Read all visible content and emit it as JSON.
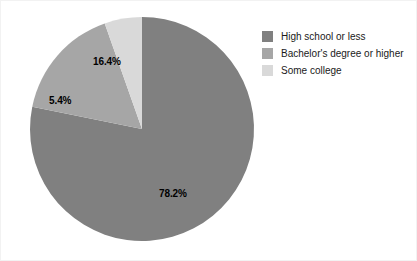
{
  "chart_data": {
    "type": "pie",
    "title": "",
    "subtitle": "",
    "xlabel": "",
    "ylabel": "",
    "grid": false,
    "legend_position": "right",
    "start_angle_deg": 0,
    "direction": "clockwise",
    "categories": [
      "High school or less",
      "Bachelor's degree or higher",
      "Some college"
    ],
    "values": [
      78.2,
      16.4,
      5.4
    ],
    "data_labels": [
      "78.2%",
      "16.4%",
      "5.4%"
    ],
    "colors": [
      "#808080",
      "#a6a6a6",
      "#d9d9d9"
    ],
    "slices": [
      {
        "label": "High school or less",
        "value": 78.2,
        "data_label": "78.2%",
        "color": "#808080"
      },
      {
        "label": "Bachelor's degree or higher",
        "value": 16.4,
        "data_label": "16.4%",
        "color": "#a6a6a6"
      },
      {
        "label": "Some college",
        "value": 5.4,
        "data_label": "5.4%",
        "color": "#d9d9d9"
      }
    ]
  },
  "legend": {
    "items": [
      {
        "label": "High school or less",
        "color": "#808080"
      },
      {
        "label": "Bachelor's degree or higher",
        "color": "#a6a6a6"
      },
      {
        "label": "Some college",
        "color": "#d9d9d9"
      }
    ]
  },
  "labels": {
    "major": "78.2%",
    "middle": "16.4%",
    "minor": "5.4%"
  },
  "style": {
    "background": "#ffffff",
    "border_color": "#f2f2f2",
    "label_color": "#000000",
    "legend_text_color": "#1a1a1a"
  }
}
